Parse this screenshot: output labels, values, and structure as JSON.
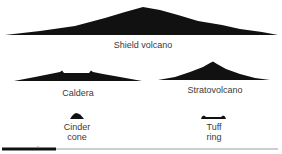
{
  "diagram": {
    "fill_color": "#111111",
    "scale_bar_color": "#111111",
    "scale_line_color": "#9a9a9a",
    "volcanoes": [
      {
        "id": "shield",
        "label": "Shield volcano",
        "label_lines": [
          "Shield volcano"
        ],
        "label_pos": [
          143,
          40
        ],
        "path": "M5,35 L40,31 L75,26 L105,18 L125,12 L143,7 L160,10 L178,15 L198,21 L222,25 L240,29 L262,32 L278,35 Z"
      },
      {
        "id": "caldera",
        "label": "Caldera",
        "label_lines": [
          "Caldera"
        ],
        "label_pos": [
          78,
          88
        ],
        "path": "M14,81 L35,77 L50,74 L60,72 L62,70.5 L64,73 L75,73 L89,73 L91,70.5 L93,72 L103,74 L120,77 L142,81 Z"
      },
      {
        "id": "stratovolcano",
        "label": "Stratovolcano",
        "label_lines": [
          "Stratovolcano"
        ],
        "label_pos": [
          215,
          85
        ],
        "path": "M158,80 L175,77 L190,72 L203,67 L210,63 L213,61.5 L217,64 L226,69 L240,74 L255,78 L270,80 Z"
      },
      {
        "id": "cinder-cone",
        "label": "Cinder cone",
        "label_lines": [
          "Cinder",
          "cone"
        ],
        "label_pos": [
          77,
          122
        ],
        "path": "M70,119 L72,116 L74,114 L76,113 L78,113.5 L80,114.5 L82,116.5 L84,119 Z"
      },
      {
        "id": "tuff-ring",
        "label": "Tuff ring",
        "label_lines": [
          "Tuff",
          "ring"
        ],
        "label_pos": [
          214,
          122
        ],
        "path": "M201,119 L202,116.5 L204,115.5 L206,117 L221,117 L223,115.5 L225,116.5 L226,119 Z"
      }
    ],
    "scale_bar": {
      "black_segment": [
        2,
        56
      ],
      "line_extent": [
        2,
        278
      ],
      "y": 149
    }
  }
}
